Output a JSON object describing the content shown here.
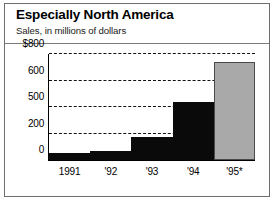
{
  "header": {
    "title": "Especially North America",
    "subtitle": "Sales, in millions of dollars"
  },
  "colors": {
    "bar_actual": "#0a0a0a",
    "bar_projected": "#a9a9a9",
    "frame": "#6e6e6e",
    "gridline": "#111111",
    "axis": "#000000",
    "background": "#ffffff"
  },
  "chart_data": {
    "type": "bar",
    "title": "Especially North America",
    "subtitle": "Sales, in millions of dollars",
    "xlabel": "",
    "ylabel": "",
    "categories": [
      "1991",
      "'92",
      "'93",
      "'94",
      "'95*"
    ],
    "values": [
      50,
      70,
      170,
      520,
      740
    ],
    "series": [
      {
        "name": "Sales",
        "values": [
          50,
          70,
          170,
          520,
          740
        ],
        "point_styles": [
          "actual",
          "actual",
          "actual",
          "actual",
          "projected"
        ]
      }
    ],
    "ytick_labels": [
      "0",
      "200",
      "500",
      "600",
      "$800"
    ],
    "ytick_values": [
      0,
      200,
      500,
      600,
      800
    ],
    "ytick_positions_pct": [
      0,
      25,
      50,
      75,
      100
    ],
    "grid": true,
    "grid_style": "dashed",
    "grid_axis": "y",
    "legend": false,
    "note": "'95* is a projected figure shown in gray"
  }
}
